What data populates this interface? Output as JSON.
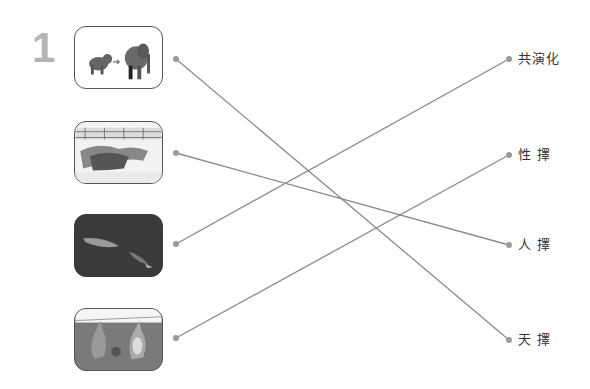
{
  "exercise_number": "1",
  "left_items": [
    {
      "id": "img-elephant-evolution",
      "desc": "small animal arrow elephant",
      "bg": "#ffffff"
    },
    {
      "id": "img-greyhound-race",
      "desc": "greyhounds racing",
      "bg": "#f3f3f3"
    },
    {
      "id": "img-fish-deep-sea",
      "desc": "fish in dark water",
      "bg": "#3a3a3a"
    },
    {
      "id": "img-kangaroos",
      "desc": "kangaroos",
      "bg": "#7a7a7a"
    }
  ],
  "right_items": [
    {
      "label": "共演化"
    },
    {
      "label": "性 擇"
    },
    {
      "label": "人 擇"
    },
    {
      "label": "天 擇"
    }
  ],
  "connections": [
    {
      "from": 0,
      "to": 3
    },
    {
      "from": 1,
      "to": 2
    },
    {
      "from": 2,
      "to": 0
    },
    {
      "from": 3,
      "to": 1
    }
  ],
  "colors": {
    "line": "#8a8a8a",
    "dot": "#9a9a9a",
    "number": "#b4b4b4",
    "border": "#555555"
  }
}
